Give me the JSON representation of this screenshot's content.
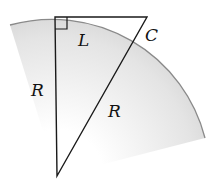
{
  "diagram": {
    "type": "geometry",
    "labels": {
      "left_side": "R",
      "hypotenuse": "R",
      "top_segment": "L",
      "outer_piece": "C"
    },
    "vertices": {
      "center": [
        57,
        176
      ],
      "tangent_point": [
        55,
        17
      ],
      "far_point": [
        147,
        17
      ]
    },
    "colors": {
      "line": "#1a1a1a",
      "arc": "#8a8a8a",
      "shade_outer": "#cfcfcf",
      "shade_inner": "#ffffff"
    }
  }
}
